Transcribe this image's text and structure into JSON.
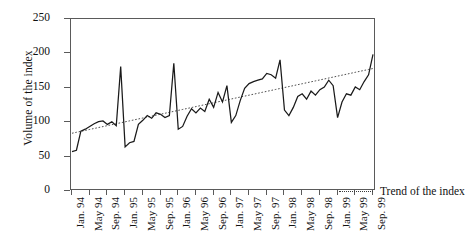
{
  "chart_data": {
    "type": "line",
    "title": "",
    "xlabel": "",
    "ylabel": "Volume of the index",
    "ylim": [
      0,
      250
    ],
    "yticks": [
      0,
      50,
      100,
      150,
      200,
      250
    ],
    "grid": false,
    "legend_position": "inside-bottom-right",
    "legend": [
      "Trend of the index"
    ],
    "x": [
      "Jan. 94",
      "Feb. 94",
      "Mar. 94",
      "Apr. 94",
      "May 94",
      "Jun. 94",
      "Jul. 94",
      "Aug. 94",
      "Sep. 94",
      "Oct. 94",
      "Nov. 94",
      "Dec. 94",
      "Jan. 95",
      "Feb. 95",
      "Mar. 95",
      "Apr. 95",
      "May 95",
      "Jun. 95",
      "Jul. 95",
      "Aug. 95",
      "Sep. 95",
      "Oct. 95",
      "Nov. 95",
      "Dec. 95",
      "Jan. 96",
      "Feb. 96",
      "Mar. 96",
      "Apr. 96",
      "May 96",
      "Jun. 96",
      "Jul. 96",
      "Aug. 96",
      "Sep. 96",
      "Oct. 96",
      "Nov. 96",
      "Dec. 96",
      "Jan. 97",
      "Feb. 97",
      "Mar. 97",
      "Apr. 97",
      "May 97",
      "Jun. 97",
      "Jul. 97",
      "Aug. 97",
      "Sep. 97",
      "Oct. 97",
      "Nov. 97",
      "Dec. 97",
      "Jan. 98",
      "Feb. 98",
      "Mar. 98",
      "Apr. 98",
      "May 98",
      "Jun. 98",
      "Jul. 98",
      "Aug. 98",
      "Sep. 98",
      "Oct. 98",
      "Nov. 98",
      "Dec. 98",
      "Jan. 99",
      "Feb. 99",
      "Mar. 99",
      "Apr. 99",
      "May 99",
      "Jun. 99",
      "Jul. 99",
      "Aug. 99",
      "Sep. 99"
    ],
    "xtick_labels": [
      "Jan. 94",
      "May 94",
      "Sep. 94",
      "Jan. 95",
      "May 95",
      "Sep. 95",
      "Jan. 96",
      "May 96",
      "Sep. 96",
      "Jan. 97",
      "May 97",
      "Sep. 97",
      "Jan. 98",
      "May 98",
      "Sep. 98",
      "Jan. 99",
      "May 99",
      "Sep. 99"
    ],
    "series": [
      {
        "name": "Volume of the index",
        "style": "solid",
        "color": "#1a1a1a",
        "values": [
          55,
          57,
          85,
          88,
          92,
          96,
          99,
          100,
          95,
          99,
          93,
          180,
          62,
          68,
          70,
          95,
          101,
          108,
          104,
          112,
          110,
          105,
          108,
          185,
          88,
          92,
          107,
          118,
          112,
          119,
          114,
          132,
          120,
          142,
          128,
          152,
          98,
          108,
          130,
          148,
          155,
          158,
          160,
          162,
          170,
          168,
          163,
          190,
          116,
          108,
          120,
          136,
          140,
          132,
          144,
          138,
          146,
          150,
          160,
          152,
          105,
          128,
          140,
          138,
          150,
          146,
          158,
          168,
          198
        ]
      },
      {
        "name": "Trend of the index",
        "style": "dotted",
        "color": "#3a3a3a",
        "values": [
          82,
          83.4,
          84.8,
          86.2,
          87.6,
          89.0,
          90.4,
          91.8,
          93.2,
          94.6,
          96.0,
          97.4,
          98.8,
          100.2,
          101.6,
          103.0,
          104.4,
          105.8,
          107.2,
          108.6,
          110.0,
          111.4,
          112.8,
          114.2,
          115.6,
          117.0,
          118.4,
          119.8,
          121.2,
          122.6,
          124.0,
          125.4,
          126.8,
          128.2,
          129.6,
          131.0,
          132.4,
          133.8,
          135.2,
          136.6,
          138.0,
          139.4,
          140.8,
          142.2,
          143.6,
          145.0,
          146.4,
          147.8,
          149.2,
          150.6,
          152.0,
          153.4,
          154.8,
          156.2,
          157.6,
          159.0,
          160.4,
          161.8,
          163.2,
          164.6,
          166.0,
          167.4,
          168.8,
          170.2,
          171.6,
          173.0,
          174.4,
          175.8,
          177.2
        ]
      }
    ]
  },
  "axis": {
    "ylabel": "Volume of the index"
  },
  "legend": {
    "trend_label": "Trend of the index"
  }
}
